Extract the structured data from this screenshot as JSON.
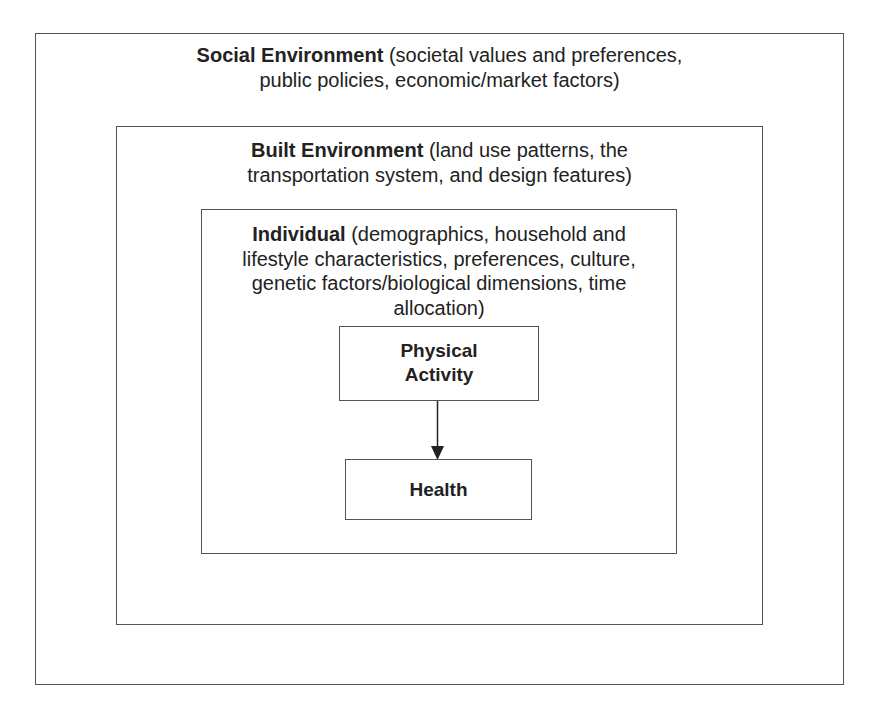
{
  "diagram": {
    "layers": [
      {
        "id": "social",
        "title": "Social Environment",
        "description_lines": [
          "(societal values and preferences,",
          "public policies, economic/market factors)"
        ]
      },
      {
        "id": "built",
        "title": "Built Environment",
        "description_lines": [
          "(land use patterns, the",
          "transportation system, and design features)"
        ]
      },
      {
        "id": "individual",
        "title": "Individual",
        "description_lines": [
          "(demographics, household and",
          "lifestyle characteristics, preferences, culture,",
          "genetic factors/biological dimensions, time",
          "allocation)"
        ]
      }
    ],
    "nodes": {
      "physical_activity": {
        "line1": "Physical",
        "line2": "Activity"
      },
      "health": {
        "label": "Health"
      }
    },
    "edges": [
      {
        "from": "Physical Activity",
        "to": "Health"
      }
    ],
    "colors": {
      "border": "#555555",
      "text": "#222222",
      "background": "#ffffff"
    }
  }
}
